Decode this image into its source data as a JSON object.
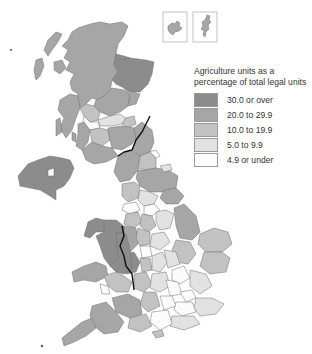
{
  "legend": {
    "title_line1": "Agriculture units as a",
    "title_line2": "percentage of total legal units",
    "items": [
      {
        "label": "30.0 or over",
        "color": "#8c8c8c"
      },
      {
        "label": "20.0 to 29.9",
        "color": "#a6a6a6"
      },
      {
        "label": "10.0 to 19.9",
        "color": "#c2c2c2"
      },
      {
        "label": "5.0 to 9.9",
        "color": "#e2e2e2"
      },
      {
        "label": "4.9 or under",
        "color": "#fbfbfb"
      }
    ]
  },
  "map": {
    "insets": [
      "Orkney",
      "Shetland"
    ]
  }
}
